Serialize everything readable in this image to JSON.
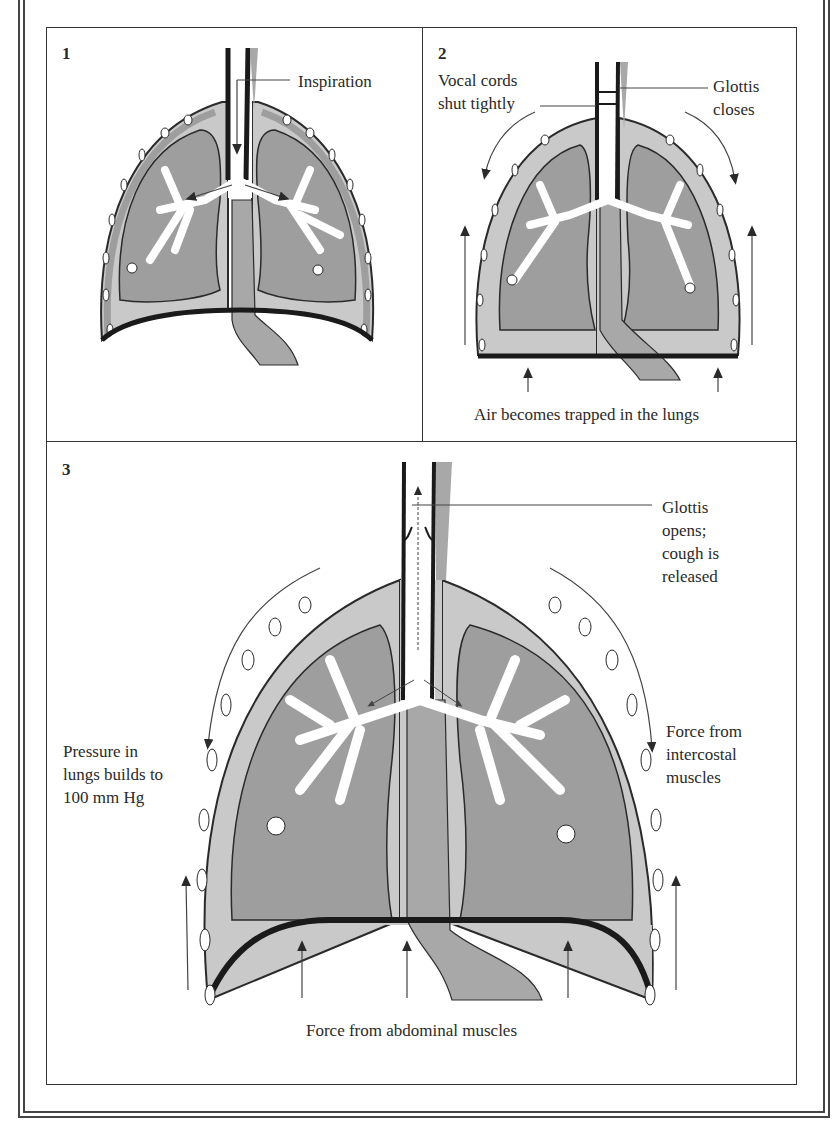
{
  "figure": {
    "panels": [
      {
        "number": "1",
        "labels": {
          "inspiration": "Inspiration"
        }
      },
      {
        "number": "2",
        "labels": {
          "vocal_cords_line1": "Vocal cords",
          "vocal_cords_line2": "shut tightly",
          "glottis_line1": "Glottis",
          "glottis_line2": "closes",
          "air_trapped": "Air becomes trapped in the lungs"
        }
      },
      {
        "number": "3",
        "labels": {
          "glottis_opens_line1": "Glottis",
          "glottis_opens_line2": "opens;",
          "glottis_opens_line3": "cough is",
          "glottis_opens_line4": "released",
          "pressure_line1": "Pressure in",
          "pressure_line2": "lungs builds to",
          "pressure_line3": "100 mm Hg",
          "intercostal_line1": "Force from",
          "intercostal_line2": "intercostal",
          "intercostal_line3": "muscles",
          "abdominal": "Force from abdominal muscles"
        }
      }
    ]
  },
  "colors": {
    "pleura_light": "#c9c9c9",
    "lung_dark": "#9e9e9e",
    "outline": "#2a2a2a",
    "airway": "#ffffff",
    "rib": "#ffffff",
    "esophagus": "#a8a8a8"
  }
}
